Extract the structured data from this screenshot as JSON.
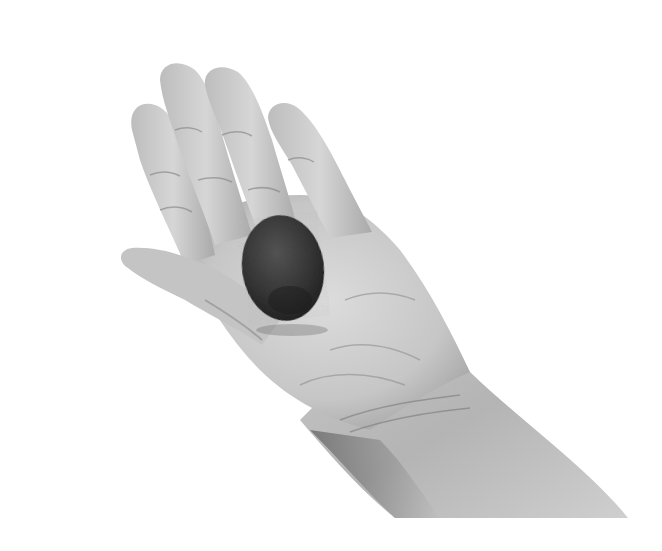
{
  "image": {
    "description": "Black-and-white photograph of an open hand, palm up, holding a dark round stone",
    "subject": "hand holding stone",
    "colors": {
      "background": "#ffffff",
      "skin_light": "#d2d2d2",
      "skin_mid": "#a8a8a8",
      "skin_shadow": "#6e6e6e",
      "stone": "#2e2e2e",
      "stone_highlight": "#5a5a5a"
    }
  }
}
